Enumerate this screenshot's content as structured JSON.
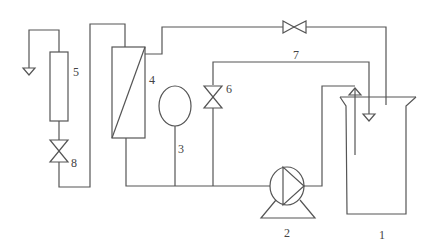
{
  "diagram": {
    "type": "process-flow schematic",
    "components": [
      {
        "id": "1",
        "label": "1",
        "kind": "tank"
      },
      {
        "id": "2",
        "label": "2",
        "kind": "pump"
      },
      {
        "id": "3",
        "label": "3",
        "kind": "pressure-vessel"
      },
      {
        "id": "4",
        "label": "4",
        "kind": "membrane-module"
      },
      {
        "id": "5",
        "label": "5",
        "kind": "flow-meter"
      },
      {
        "id": "6",
        "label": "6",
        "kind": "valve"
      },
      {
        "id": "7",
        "label": "7",
        "kind": "return-line"
      },
      {
        "id": "8",
        "label": "8",
        "kind": "valve"
      }
    ],
    "unlabeled": [
      {
        "kind": "valve",
        "location": "top line"
      },
      {
        "kind": "vent-arrow",
        "location": "left outlet"
      },
      {
        "kind": "inlet-arrow",
        "location": "tank"
      },
      {
        "kind": "outlet-arrow",
        "location": "tank line 7"
      }
    ]
  },
  "labels": {
    "tank": "1",
    "pump": "2",
    "vessel": "3",
    "module": "4",
    "meter": "5",
    "valve6": "6",
    "line7": "7",
    "valve8": "8"
  }
}
